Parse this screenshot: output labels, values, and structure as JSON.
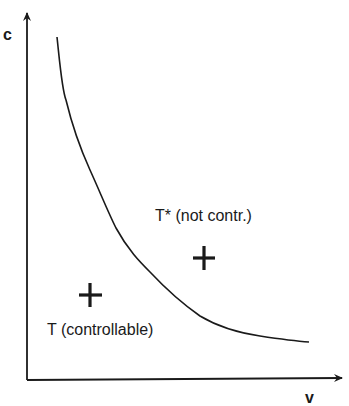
{
  "figure": {
    "axes": {
      "y_label": "c",
      "x_label": "v"
    },
    "regions": [
      {
        "id": "T_star",
        "label": "T* (not contr.)",
        "marker": "cross",
        "description": "above curve"
      },
      {
        "id": "T",
        "label": "T (controllable)",
        "marker": "cross",
        "description": "below curve"
      }
    ],
    "curve": {
      "type": "decreasing-convex boundary",
      "separates": [
        "T (controllable)",
        "T* (not contr.)"
      ]
    },
    "colors": {
      "ink": "#1a1a1a",
      "background": "#ffffff"
    }
  }
}
